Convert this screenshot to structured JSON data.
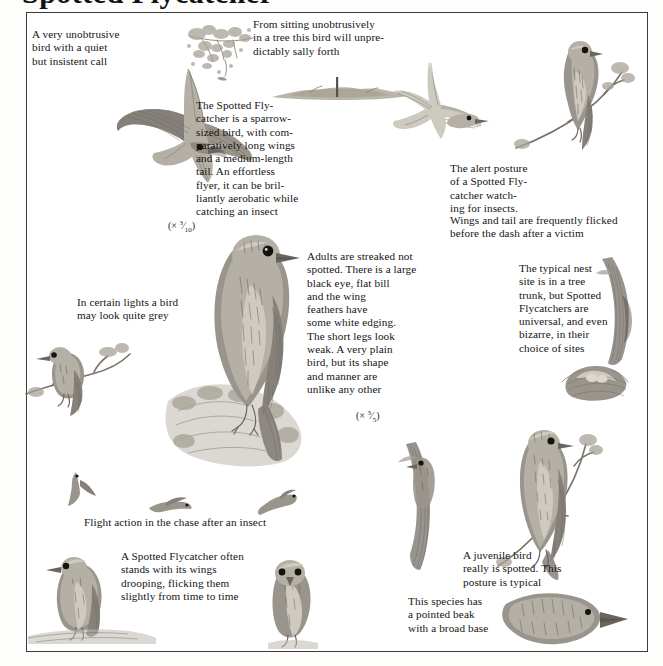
{
  "page": {
    "heading_partial": "Spotted Flycatcher",
    "plate_title": "Spotted Flycatcher illustration plate"
  },
  "captions": [
    {
      "id": "unobtrusive-call",
      "text": "A very unobtrusive\nbird with a quiet\nbut insistent call"
    },
    {
      "id": "sally-forth",
      "text": "From sitting unobtrusively\nin a tree this bird will unpre-\ndictably sally forth"
    },
    {
      "id": "sparrow-sized",
      "text": "The Spotted Fly-\ncatcher is a sparrow-\nsized bird, with com-\nparatively long wings\nand a medium-length\ntail. An effortless\nflyer, it can be bril-\nliantly aerobatic while\ncatching an insect"
    },
    {
      "id": "alert-posture",
      "text": "The alert posture\nof a Spotted Fly-\ncatcher watch-\ning for insects."
    },
    {
      "id": "wings-flicked",
      "text": "Wings and tail are frequently flicked\nbefore the dash after a victim"
    },
    {
      "id": "adults-streaked",
      "text": "Adults are streaked not\nspotted. There is a large\nblack eye, flat bill\nand the wing\nfeathers have\nsome white edging.\nThe short legs look\nweak. A very plain\nbird, but its shape\nand manner are\nunlike any other"
    },
    {
      "id": "typical-nest",
      "text": "The typical nest\nsite is in a tree\ntrunk, but Spotted\nFlycatchers are\nuniversal, and even\nbizarre, in their\nchoice of sites"
    },
    {
      "id": "certain-lights",
      "text": "In certain lights a bird\nmay look quite grey"
    },
    {
      "id": "flight-action",
      "text": "Flight action in the chase after an insect"
    },
    {
      "id": "wings-drooping",
      "text": "A Spotted Flycatcher often\nstands with its wings\ndrooping, flicking them\nslightly from time to time"
    },
    {
      "id": "juvenile-spotted",
      "text": "A juvenile bird\nreally is spotted. This\nposture is typical"
    },
    {
      "id": "pointed-beak",
      "text": "This species has\na pointed beak\nwith a broad base"
    }
  ],
  "scales": [
    {
      "id": "scale-flight",
      "prefix": "(× ",
      "numerator": "3",
      "denominator": "10",
      "suffix": ")"
    },
    {
      "id": "scale-main",
      "prefix": "(× ",
      "numerator": "3",
      "denominator": "5",
      "suffix": ")"
    }
  ],
  "artwork": [
    {
      "id": "flying-bird-underside",
      "label": "Spotted Flycatcher in flight, seen from below, wings spread"
    },
    {
      "id": "tree-branch-sketch",
      "label": "Sketch of a leafy tree branch perch"
    },
    {
      "id": "bird-leaving-perch",
      "label": "Tiny bird sallying forth from perch"
    },
    {
      "id": "hedge-line",
      "label": "Soft hedge and post landscape line"
    },
    {
      "id": "flying-bird-side",
      "label": "Spotted Flycatcher gliding, side view"
    },
    {
      "id": "perched-bird-upright",
      "label": "Spotted Flycatcher perched upright on a branch, alert posture"
    },
    {
      "id": "main-bird-large",
      "label": "Large study of adult Spotted Flycatcher perched on a stump"
    },
    {
      "id": "grey-bird-branch",
      "label": "Spotted Flycatcher looking grey, on a branch"
    },
    {
      "id": "nest-in-trunk",
      "label": "Nest built in a tree trunk crevice"
    },
    {
      "id": "nest-cup",
      "label": "Cup nest with eggs on a ledge"
    },
    {
      "id": "flight-silhouette-1",
      "label": "Flight action silhouette, wings down"
    },
    {
      "id": "flight-silhouette-2",
      "label": "Flight action silhouette, wings level"
    },
    {
      "id": "flight-silhouette-3",
      "label": "Flight action silhouette, wings back"
    },
    {
      "id": "bird-wings-drooping",
      "label": "Spotted Flycatcher standing with drooping wings on a wall"
    },
    {
      "id": "bird-front-view",
      "label": "Spotted Flycatcher front view on a post"
    },
    {
      "id": "juvenile-on-trunk",
      "label": "Juvenile Spotted Flycatcher clinging to a trunk"
    },
    {
      "id": "juvenile-perched",
      "label": "Juvenile Spotted Flycatcher perched, spotted plumage"
    },
    {
      "id": "head-detail-beak",
      "label": "Head detail showing pointed beak with broad base"
    }
  ]
}
